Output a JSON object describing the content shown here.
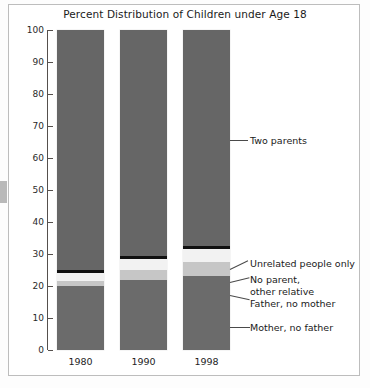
{
  "chart_data": {
    "type": "bar",
    "subtype": "stacked-percent",
    "title": "Percent Distribution of Children under Age 18",
    "xlabel": "",
    "ylabel": "",
    "ylim": [
      0,
      100
    ],
    "ytick_labels": [
      "0",
      "10",
      "20",
      "30",
      "40",
      "50",
      "60",
      "70",
      "80",
      "90",
      "100"
    ],
    "ytick_values": [
      0,
      10,
      20,
      30,
      40,
      50,
      60,
      70,
      80,
      90,
      100
    ],
    "grid": false,
    "legend_position": "right-callouts",
    "categories": [
      "1980",
      "1990",
      "1998"
    ],
    "series": [
      {
        "name": "Mother, no father",
        "color": "#6b6b6b",
        "values": [
          20,
          22,
          23
        ]
      },
      {
        "name": "Father, no mother",
        "color": "#c6c6c6",
        "values": [
          1.5,
          3,
          4.5
        ]
      },
      {
        "name": "No parent, other relative",
        "color": "#f2f2f2",
        "values": [
          2.5,
          3.5,
          4
        ]
      },
      {
        "name": "Unrelated people only",
        "color": "#111111",
        "values": [
          1,
          1,
          1
        ]
      },
      {
        "name": "Two parents",
        "color": "#666666",
        "values": [
          75,
          70.5,
          67.5
        ]
      }
    ],
    "annotations": [
      {
        "label": "Two parents"
      },
      {
        "label": "Unrelated people only"
      },
      {
        "label": "No parent,\nother relative"
      },
      {
        "label": "Father, no mother"
      },
      {
        "label": "Mother, no father"
      }
    ]
  },
  "colors": {
    "two_parents": "#666666",
    "unrelated": "#111111",
    "no_parent_other_relative": "#f2f2f2",
    "father_no_mother": "#c6c6c6",
    "mother_no_father": "#6b6b6b",
    "axis": "#55504d",
    "frame": "#bdbdbd"
  }
}
